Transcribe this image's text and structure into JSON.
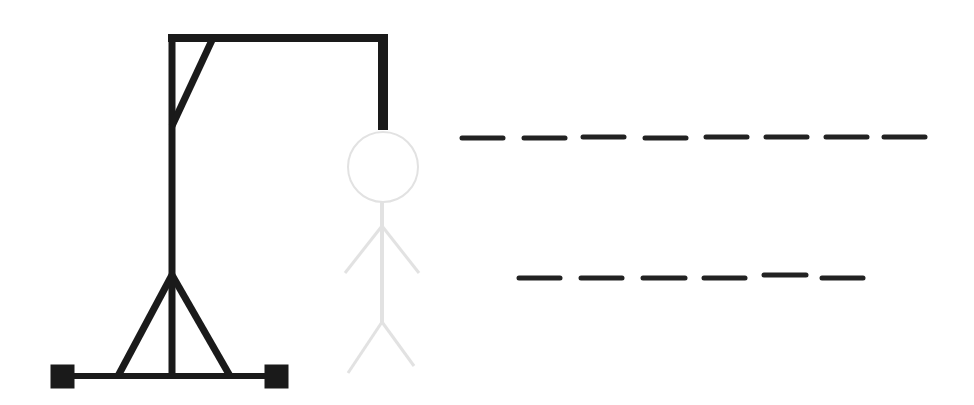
{
  "game": {
    "type": "hangman",
    "colors": {
      "background": "#ffffff",
      "gallows": "#1a1a1a",
      "figure": "#e2e2e2",
      "dash": "#222222"
    },
    "figure_parts_shown": [
      "head",
      "body",
      "left-arm",
      "right-arm",
      "left-leg",
      "right-leg"
    ],
    "word_rows": [
      {
        "letters": [
          "",
          "",
          "",
          "",
          "",
          "",
          "",
          ""
        ],
        "length": 8
      },
      {
        "letters": [
          "",
          "",
          "",
          "",
          "",
          ""
        ],
        "length": 6
      }
    ]
  }
}
